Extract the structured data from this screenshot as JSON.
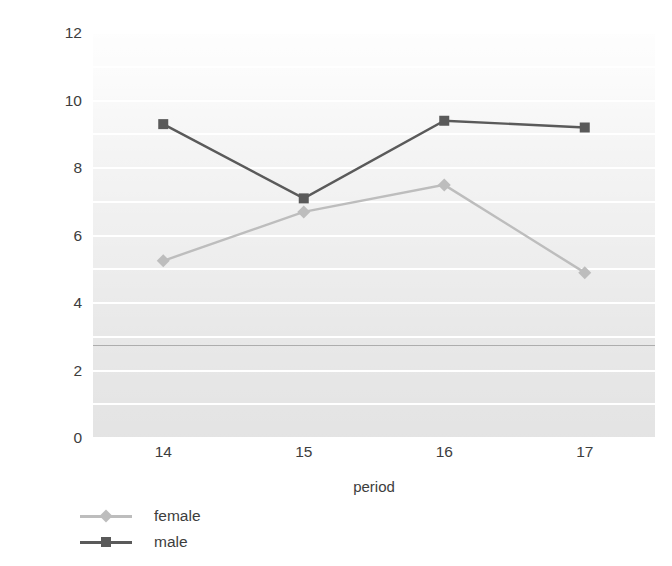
{
  "chart_data": {
    "type": "line",
    "title": "",
    "xlabel": "period",
    "ylabel": "% prevalence",
    "categories": [
      "14",
      "15",
      "16",
      "17"
    ],
    "x": [
      14,
      15,
      16,
      17
    ],
    "xlim": [
      13.5,
      17.5
    ],
    "ylim": [
      0,
      12
    ],
    "yticks": [
      0,
      2,
      4,
      6,
      8,
      10,
      12
    ],
    "ytick_labels": [
      "0",
      "2",
      "4",
      "6",
      "8",
      "10",
      "12"
    ],
    "xtick_labels": [
      "14",
      "15",
      "16",
      "17"
    ],
    "grid": true,
    "grid_color": "#ffffff",
    "grid_interval": 1,
    "plot_background": "#d8d8d8",
    "reference_line_value": 2.75,
    "legend_position": "bottom-left",
    "series": [
      {
        "name": "female",
        "color": "#bdbdbd",
        "marker": "diamond",
        "values": [
          5.25,
          6.7,
          7.5,
          4.9
        ]
      },
      {
        "name": "male",
        "color": "#5a5a5a",
        "marker": "square",
        "values": [
          9.3,
          7.1,
          9.4,
          9.2
        ]
      }
    ]
  },
  "legend": {
    "items": [
      {
        "label": "female"
      },
      {
        "label": "male"
      }
    ]
  },
  "colors": {
    "female": "#bdbdbd",
    "male": "#5a5a5a",
    "text": "#3d3d3d",
    "grid": "#ffffff",
    "plot_bg": "#d8d8d8"
  }
}
